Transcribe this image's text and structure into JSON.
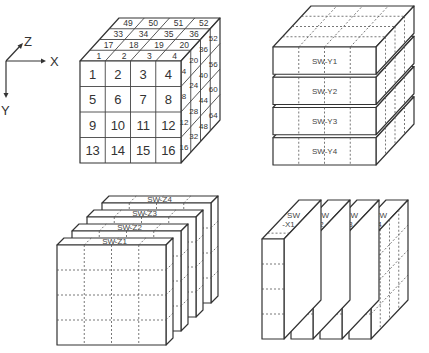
{
  "axes": {
    "x_label": "X",
    "y_label": "Y",
    "z_label": "Z"
  },
  "cube_numbered": {
    "front_face": [
      [
        "1",
        "2",
        "3",
        "4"
      ],
      [
        "5",
        "6",
        "7",
        "8"
      ],
      [
        "9",
        "10",
        "11",
        "12"
      ],
      [
        "13",
        "14",
        "15",
        "16"
      ]
    ],
    "top_rows": [
      [
        "1",
        "2",
        "3",
        "4"
      ],
      [
        "17",
        "18",
        "19",
        "20"
      ],
      [
        "33",
        "34",
        "35",
        "36"
      ],
      [
        "49",
        "50",
        "51",
        "52"
      ]
    ],
    "side_cols": [
      [
        "4",
        "8",
        "12",
        "16"
      ],
      [
        "20",
        "24",
        "28",
        "32"
      ],
      [
        "36",
        "40",
        "44",
        "48"
      ],
      [
        "52",
        "56",
        "60",
        "64"
      ]
    ]
  },
  "cube_y_slabs": {
    "labels": [
      "SW-Y1",
      "SW-Y2",
      "SW-Y3",
      "SW-Y4"
    ]
  },
  "cube_z_slabs": {
    "labels": [
      "SW-Z1",
      "SW-Z2",
      "SW-Z3",
      "SW-Z4"
    ]
  },
  "cube_x_slabs": {
    "labels": [
      [
        "SW",
        "-X1"
      ],
      [
        "SW",
        "-X2"
      ],
      [
        "SW",
        "-X3"
      ],
      [
        "SW",
        "-X4"
      ]
    ]
  }
}
